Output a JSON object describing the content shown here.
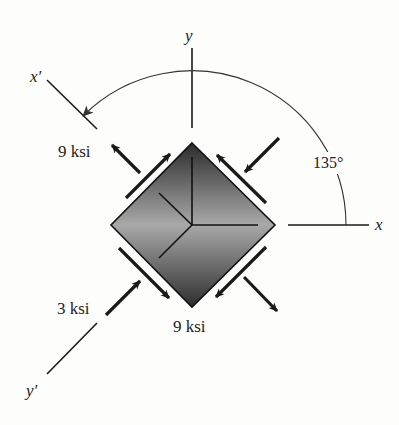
{
  "figure": {
    "axes": {
      "x": "x",
      "y": "y",
      "x_prime": "x′",
      "y_prime": "y′"
    },
    "angle_label": "135°",
    "stress_labels": {
      "upper_left": "9 ksi",
      "bottom": "9 ksi",
      "lower_left": "3 ksi"
    },
    "colors": {
      "line": "#1a1a1a",
      "element_dark": "#2a2a2a",
      "element_light": "#a8a8a8",
      "background": "#fdfdfb"
    }
  }
}
